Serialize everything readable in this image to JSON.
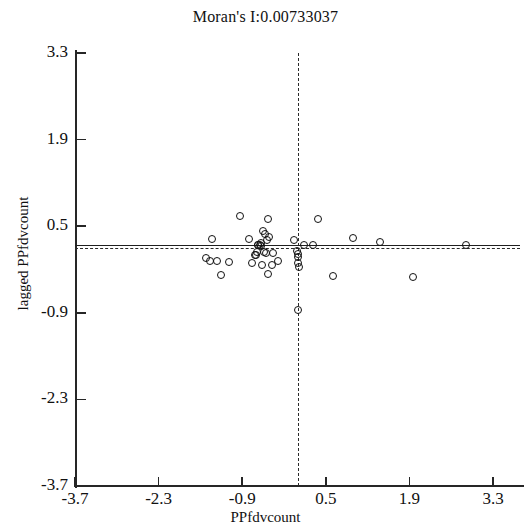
{
  "chart_data": {
    "type": "scatter",
    "title": "Moran's I:0.00733037",
    "xlabel": "PPfdvcount",
    "ylabel": "lagged PPfdvcount",
    "xlim": [
      -3.7,
      3.75
    ],
    "ylim": [
      -3.7,
      3.3
    ],
    "grid": false,
    "legend": null,
    "x_ticks": [
      "-3.7",
      "-2.3",
      "-0.9",
      "0.5",
      "1.9",
      "3.3"
    ],
    "x_tick_values": [
      -3.7,
      -2.3,
      -0.9,
      0.5,
      1.9,
      3.3
    ],
    "y_ticks": [
      "3.3",
      "1.9",
      "0.5",
      "-0.9",
      "-2.3",
      "-3.7"
    ],
    "y_tick_values": [
      3.3,
      1.9,
      0.5,
      -0.9,
      -2.3,
      -3.7
    ],
    "reference_lines": [
      {
        "name": "mean-x-dashed-vertical",
        "orientation": "vertical",
        "value": 0.03,
        "style": "dashed"
      },
      {
        "name": "mean-y-dashed-horizontal",
        "orientation": "horizontal",
        "value": 0.14,
        "style": "dashed"
      },
      {
        "name": "regression-line-solid",
        "orientation": "horizontal",
        "value": 0.2,
        "style": "solid",
        "slope": 0.00733037
      }
    ],
    "moran_i": 0.00733037,
    "n_points": 44,
    "points": [
      {
        "x": -0.93,
        "y": 0.66
      },
      {
        "x": -0.47,
        "y": 0.62
      },
      {
        "x": 0.37,
        "y": 0.62
      },
      {
        "x": -0.55,
        "y": 0.42
      },
      {
        "x": -0.52,
        "y": 0.37
      },
      {
        "x": -0.46,
        "y": 0.32
      },
      {
        "x": -0.49,
        "y": 0.27
      },
      {
        "x": -1.41,
        "y": 0.3
      },
      {
        "x": -0.78,
        "y": 0.3
      },
      {
        "x": -0.58,
        "y": 0.23
      },
      {
        "x": -0.03,
        "y": 0.27
      },
      {
        "x": 0.95,
        "y": 0.31
      },
      {
        "x": 1.41,
        "y": 0.25
      },
      {
        "x": -0.64,
        "y": 0.2
      },
      {
        "x": -0.61,
        "y": 0.2
      },
      {
        "x": -0.63,
        "y": 0.19
      },
      {
        "x": -0.59,
        "y": 0.18
      },
      {
        "x": 0.14,
        "y": 0.2
      },
      {
        "x": 0.28,
        "y": 0.2
      },
      {
        "x": 2.85,
        "y": 0.19
      },
      {
        "x": -0.66,
        "y": 0.08
      },
      {
        "x": -0.69,
        "y": 0.04
      },
      {
        "x": -0.54,
        "y": 0.09
      },
      {
        "x": -0.5,
        "y": 0.06
      },
      {
        "x": -0.38,
        "y": 0.07
      },
      {
        "x": -0.67,
        "y": 0.03
      },
      {
        "x": 0.02,
        "y": 0.1
      },
      {
        "x": 0.03,
        "y": 0.05
      },
      {
        "x": 0.04,
        "y": 0.0
      },
      {
        "x": -1.5,
        "y": -0.02
      },
      {
        "x": -1.44,
        "y": -0.06
      },
      {
        "x": -1.33,
        "y": -0.06
      },
      {
        "x": -1.13,
        "y": -0.08
      },
      {
        "x": -0.74,
        "y": -0.09
      },
      {
        "x": -0.57,
        "y": -0.12
      },
      {
        "x": -0.4,
        "y": -0.13
      },
      {
        "x": -0.3,
        "y": -0.06
      },
      {
        "x": 0.03,
        "y": -0.1
      },
      {
        "x": 0.05,
        "y": -0.16
      },
      {
        "x": -1.26,
        "y": -0.29
      },
      {
        "x": -0.47,
        "y": -0.28
      },
      {
        "x": 0.62,
        "y": -0.3
      },
      {
        "x": 1.96,
        "y": -0.32
      },
      {
        "x": 0.03,
        "y": -0.86
      }
    ]
  },
  "axes": {
    "title": "Moran's I:0.00733037",
    "x_label": "PPfdvcount",
    "y_label": "lagged PPfdvcount"
  }
}
